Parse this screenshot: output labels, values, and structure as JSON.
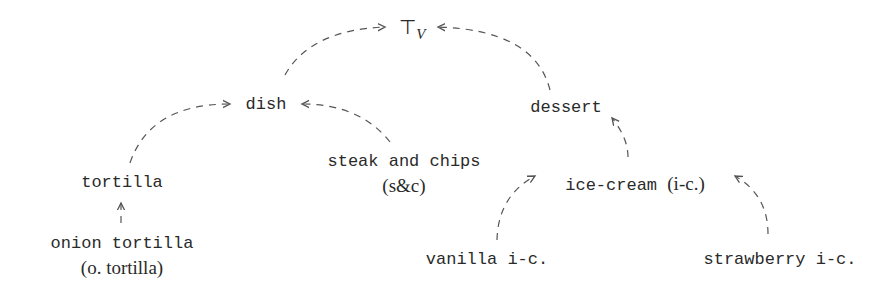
{
  "diagram": {
    "type": "hierarchy",
    "nodes": {
      "top": {
        "symbol": "⊤",
        "subscript": "V"
      },
      "dish": {
        "label": "dish"
      },
      "dessert": {
        "label": "dessert"
      },
      "tortilla": {
        "label": "tortilla"
      },
      "steak_and_chips": {
        "label": "steak and chips",
        "abbr": "(s&c)"
      },
      "ice_cream": {
        "label": "ice-cream",
        "abbr": "(i-c.)"
      },
      "onion_tortilla": {
        "label": "onion tortilla",
        "abbr": "(o. tortilla)"
      },
      "vanilla": {
        "label": "vanilla i-c."
      },
      "strawberry": {
        "label": "strawberry i-c."
      }
    },
    "edges": [
      {
        "from": "dish",
        "to": "top"
      },
      {
        "from": "dessert",
        "to": "top"
      },
      {
        "from": "tortilla",
        "to": "dish"
      },
      {
        "from": "steak_and_chips",
        "to": "dish"
      },
      {
        "from": "ice_cream",
        "to": "dessert"
      },
      {
        "from": "onion_tortilla",
        "to": "tortilla"
      },
      {
        "from": "vanilla",
        "to": "ice_cream"
      },
      {
        "from": "strawberry",
        "to": "ice_cream"
      }
    ],
    "edge_style": "dashed-arrow",
    "edge_color": "#555555"
  }
}
